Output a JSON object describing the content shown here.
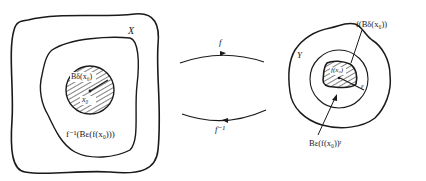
{
  "diagram": {
    "type": "continuity-mapping",
    "colors": {
      "ink": "#1a1a1a",
      "background": "#ffffff"
    },
    "left_space": {
      "label": "X",
      "inner_region_label": "f⁻¹(Bε(f(x₀)))",
      "ball_label": "Bδ(x₀)",
      "center_label": "x₀"
    },
    "arrows": {
      "forward_label": "f",
      "inverse_label": "f⁻¹"
    },
    "right_space": {
      "label": "Y",
      "image_label": "f(Bδ(x₀))",
      "center_label": "f(x₀)",
      "radius_label": "ε",
      "ball_label": "Bε(f(x₀))ʳ"
    }
  }
}
